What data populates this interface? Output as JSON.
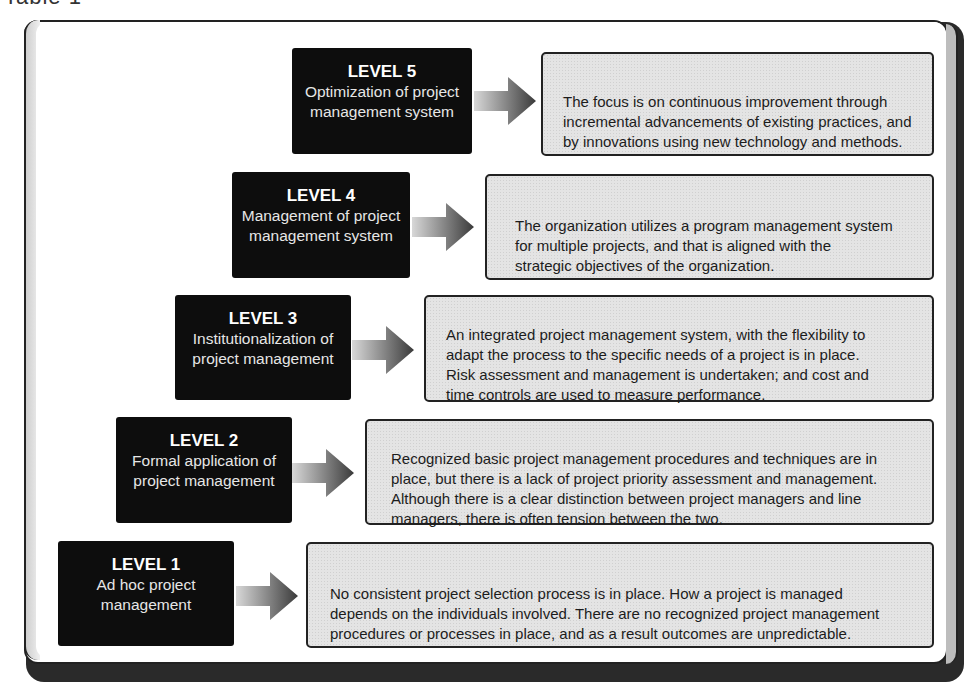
{
  "caption": "Table 1",
  "colors": {
    "level_box_bg": "#0d0d0d",
    "level_box_text": "#e6e6e6",
    "desc_box_bg": "#e4e4e4",
    "border": "#222222"
  },
  "levels": [
    {
      "title": "LEVEL 5",
      "subtitle": "Optimization of project\nmanagement system",
      "description": "The focus is on continuous improvement through\nincremental advancements of existing practices, and\nby innovations using new technology and methods.",
      "icon": "arrow-right-icon"
    },
    {
      "title": "LEVEL 4",
      "subtitle": "Management of project\nmanagement system",
      "description": "The organization utilizes a program management system\nfor multiple projects, and that is aligned with the\nstrategic objectives of the organization.",
      "icon": "arrow-right-icon"
    },
    {
      "title": "LEVEL 3",
      "subtitle": "Institutionalization of\nproject management",
      "description": "An integrated project management system, with the flexibility to\nadapt the process to the specific needs of a project is in place.\nRisk assessment and management is undertaken; and cost and\ntime controls are used to measure performance.",
      "icon": "arrow-right-icon"
    },
    {
      "title": "LEVEL 2",
      "subtitle": "Formal application of\nproject management",
      "description": "Recognized basic project management procedures and techniques are in\nplace, but there is a lack of project priority assessment and management.\nAlthough there is a clear distinction between project managers and line\nmanagers, there is often tension between the two.",
      "icon": "arrow-right-icon"
    },
    {
      "title": "LEVEL 1",
      "subtitle": "Ad hoc project\nmanagement",
      "description": "No consistent project selection process is in place. How a project is managed\ndepends on the individuals involved. There are no recognized project management\nprocedures or processes in place, and as a result outcomes are unpredictable.",
      "icon": "arrow-right-icon"
    }
  ]
}
